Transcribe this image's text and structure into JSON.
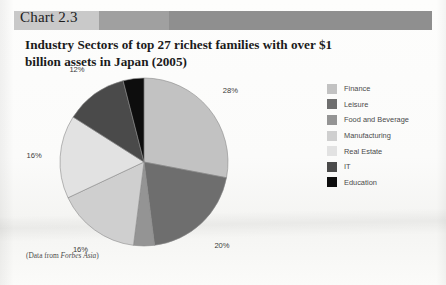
{
  "header": {
    "chart_label": "Chart 2.3",
    "band_colors": [
      "#c9c9c9",
      "#a0a0a0",
      "#8f8f8f"
    ]
  },
  "title": "Industry Sectors of top 27 richest families with over $1 billion assets in Japan (2005)",
  "source_note_prefix": "(Data from ",
  "source_note_italic": "Forbes Asia",
  "source_note_suffix": ")",
  "legend": {
    "items": [
      {
        "label": "Finance",
        "color": "#c2c2c2"
      },
      {
        "label": "Leisure",
        "color": "#6e6e6e"
      },
      {
        "label": "Food and Beverage",
        "color": "#949494"
      },
      {
        "label": "Manufacturing",
        "color": "#cfcfcf"
      },
      {
        "label": "Real Estate",
        "color": "#e2e2e2"
      },
      {
        "label": "IT",
        "color": "#4a4a4a"
      },
      {
        "label": "Education",
        "color": "#0d0d0d"
      }
    ]
  },
  "chart_data": {
    "type": "pie",
    "title": "Industry Sectors of top 27 richest families with over $1 billion assets in Japan (2005)",
    "unit": "%",
    "legend_position": "right",
    "start_angle_deg": -90,
    "labels": [
      "Finance",
      "Leisure",
      "Food and Beverage",
      "Manufacturing",
      "Real Estate",
      "IT",
      "Education"
    ],
    "values": [
      28,
      20,
      4,
      16,
      16,
      12,
      4
    ],
    "colors": [
      "#c2c2c2",
      "#6e6e6e",
      "#949494",
      "#cfcfcf",
      "#e2e2e2",
      "#4a4a4a",
      "#0d0d0d"
    ],
    "data_labels": [
      "28%",
      "20%",
      "4%",
      "16%",
      "16%",
      "12%",
      "4%"
    ],
    "total": 100
  }
}
